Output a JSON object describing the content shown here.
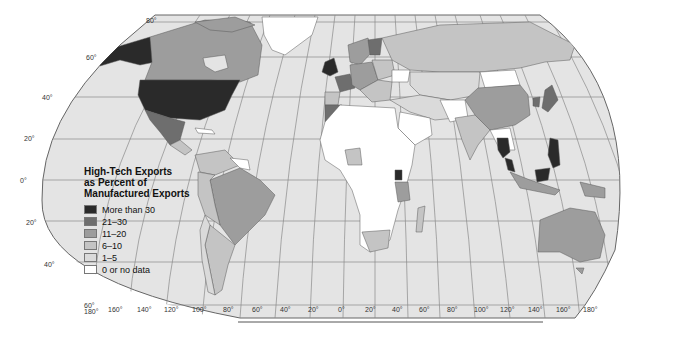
{
  "map": {
    "title": "High-Tech Exports as Percent of Manufactured Exports",
    "projection": "Robinson",
    "colors": {
      "ocean": "#e4e4e4",
      "graticule": "#8a8a8a",
      "border": "#5a5a5a"
    },
    "legend": {
      "title_lines": [
        "High-Tech Exports",
        "as Percent of",
        "Manufactured Exports"
      ],
      "items": [
        {
          "label": "More than 30",
          "color": "#2a2a2a"
        },
        {
          "label": "21–30",
          "color": "#6e6e6e"
        },
        {
          "label": "11–20",
          "color": "#9d9d9d"
        },
        {
          "label": "6–10",
          "color": "#c4c4c4"
        },
        {
          "label": "1–5",
          "color": "#dadada"
        },
        {
          "label": "0 or no data",
          "color": "#ffffff"
        }
      ]
    },
    "latitude_labels": [
      "80°",
      "60°",
      "40°",
      "20°",
      "0°",
      "20°",
      "40°",
      "60°"
    ],
    "longitude_labels": [
      "180°",
      "160°",
      "140°",
      "120°",
      "100°",
      "80°",
      "60°",
      "40°",
      "20°",
      "0°",
      "20°",
      "40°",
      "60°",
      "80°",
      "100°",
      "120°",
      "140°",
      "160°",
      "180°"
    ],
    "regions": [
      {
        "name": "United States",
        "class": "More than 30"
      },
      {
        "name": "Alaska",
        "class": "More than 30"
      },
      {
        "name": "Canada",
        "class": "11–20"
      },
      {
        "name": "Mexico",
        "class": "21–30"
      },
      {
        "name": "Central America",
        "class": "6–10"
      },
      {
        "name": "Brazil",
        "class": "11–20"
      },
      {
        "name": "Argentina",
        "class": "6–10"
      },
      {
        "name": "Colombia / Venezuela",
        "class": "6–10"
      },
      {
        "name": "Greenland",
        "class": "0 or no data"
      },
      {
        "name": "United Kingdom / Ireland",
        "class": "More than 30"
      },
      {
        "name": "France",
        "class": "21–30"
      },
      {
        "name": "Finland",
        "class": "21–30"
      },
      {
        "name": "Scandinavia",
        "class": "11–20"
      },
      {
        "name": "Central Europe",
        "class": "11–20"
      },
      {
        "name": "Ukraine",
        "class": "0 or no data"
      },
      {
        "name": "Russia",
        "class": "6–10"
      },
      {
        "name": "China",
        "class": "11–20"
      },
      {
        "name": "Mongolia",
        "class": "0 or no data"
      },
      {
        "name": "Japan",
        "class": "21–30"
      },
      {
        "name": "South Korea",
        "class": "21–30"
      },
      {
        "name": "India",
        "class": "6–10"
      },
      {
        "name": "Thailand",
        "class": "More than 30"
      },
      {
        "name": "Malaysia",
        "class": "More than 30"
      },
      {
        "name": "Philippines",
        "class": "More than 30"
      },
      {
        "name": "Indonesia",
        "class": "11–20"
      },
      {
        "name": "Papua New Guinea",
        "class": "11–20"
      },
      {
        "name": "Australia",
        "class": "11–20"
      },
      {
        "name": "New Zealand",
        "class": "6–10"
      },
      {
        "name": "Middle East / Central Asia",
        "class": "1–5"
      },
      {
        "name": "Saudi Arabia",
        "class": "0 or no data"
      },
      {
        "name": "Africa (most)",
        "class": "0 or no data"
      },
      {
        "name": "Uganda",
        "class": "More than 30"
      },
      {
        "name": "Tanzania",
        "class": "11–20"
      },
      {
        "name": "South Africa",
        "class": "6–10"
      },
      {
        "name": "Morocco",
        "class": "21–30"
      },
      {
        "name": "Madagascar",
        "class": "6–10"
      }
    ]
  }
}
